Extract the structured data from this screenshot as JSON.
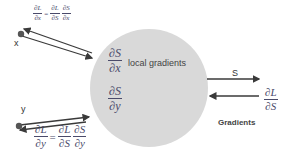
{
  "diagram": {
    "node": {
      "shape": "circle",
      "fill": "#d9d9d9",
      "label": "local gradients",
      "local_gradients": [
        {
          "num": "∂S",
          "den": "∂x"
        },
        {
          "num": "∂S",
          "den": "∂y"
        }
      ]
    },
    "inputs": {
      "x": {
        "label": "x",
        "grad": {
          "lhs_num": "∂L",
          "lhs_den": "∂x",
          "eq": "=",
          "t1_num": "∂L",
          "t1_den": "∂S",
          "t2_num": "∂S",
          "t2_den": "∂x"
        }
      },
      "y": {
        "label": "y",
        "grad": {
          "lhs_num": "∂L",
          "lhs_den": "∂y",
          "eq": "=",
          "t1_num": "∂L",
          "t1_den": "∂S",
          "t2_num": "∂S",
          "t2_den": "∂y"
        }
      }
    },
    "output": {
      "label": "S",
      "upstream_grad": {
        "num": "∂L",
        "den": "∂S"
      },
      "caption": "Gradients"
    },
    "colors": {
      "arrow": "#3a3a3a",
      "dot": "#555555",
      "math": "#4a4a6a",
      "circle": "#d9d9d9"
    }
  }
}
